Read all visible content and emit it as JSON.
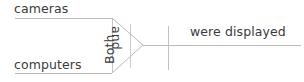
{
  "diagram": {
    "type": "sentence-diagram",
    "subjects": [
      {
        "id": "subject-upper",
        "text": "cameras"
      },
      {
        "id": "subject-lower",
        "text": "computers"
      }
    ],
    "correlative_conjunction": [
      {
        "id": "conjunction-first",
        "text": "Both",
        "rotation": "-90"
      },
      {
        "id": "conjunction-second",
        "text": "and",
        "rotation": "90"
      }
    ],
    "predicate": {
      "id": "predicate-phrase",
      "text": "were displayed"
    },
    "lines": {
      "color": "#b9b9b9",
      "stroke_width": "1",
      "upper_branch": {
        "x1": "15",
        "y1": "18",
        "x2": "112",
        "y2": "18"
      },
      "lower_branch": {
        "x1": "15",
        "y1": "73",
        "x2": "112",
        "y2": "73"
      },
      "upper_diagonal": {
        "x1": "112",
        "y1": "18",
        "x2": "143",
        "y2": "45"
      },
      "lower_diagonal": {
        "x1": "112",
        "y1": "73",
        "x2": "143",
        "y2": "45"
      },
      "bracket_left": {
        "x1": "112",
        "y1": "18",
        "x2": "112",
        "y2": "73"
      },
      "bracket_right": {
        "x1": "130",
        "y1": "24",
        "x2": "130",
        "y2": "68"
      },
      "baseline": {
        "x1": "143",
        "y1": "45",
        "x2": "301",
        "y2": "45"
      },
      "subject_predicate_divider": {
        "x1": "168",
        "y1": "26",
        "x2": "168",
        "y2": "70"
      }
    },
    "text_color": "#3b3b3b"
  }
}
